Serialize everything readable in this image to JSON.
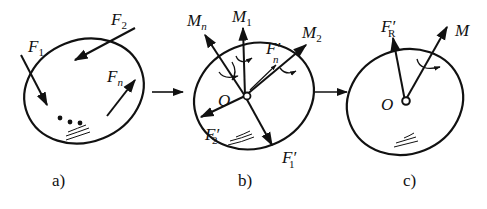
{
  "panels": [
    {
      "id": "a",
      "caption": "a)",
      "forces": [
        {
          "symbol": "F",
          "sub": "1",
          "prime": ""
        },
        {
          "symbol": "F",
          "sub": "2",
          "prime": ""
        },
        {
          "symbol": "F",
          "sub": "n",
          "prime": ""
        }
      ],
      "ellipsis": "• • •"
    },
    {
      "id": "b",
      "caption": "b)",
      "origin": "O",
      "couples": [
        {
          "symbol": "M",
          "sub": "n"
        },
        {
          "symbol": "M",
          "sub": "1"
        },
        {
          "symbol": "M",
          "sub": "2"
        }
      ],
      "forces": [
        {
          "symbol": "F",
          "sub": "n",
          "prime": "′"
        },
        {
          "symbol": "F",
          "sub": "2",
          "prime": "′"
        },
        {
          "symbol": "F",
          "sub": "1",
          "prime": "′"
        }
      ]
    },
    {
      "id": "c",
      "caption": "c)",
      "origin": "O",
      "resultant": {
        "symbol": "F",
        "sub": "R",
        "prime": "′"
      },
      "moment": {
        "symbol": "M"
      }
    }
  ],
  "colors": {
    "stroke": "#111111",
    "background": "#ffffff"
  }
}
